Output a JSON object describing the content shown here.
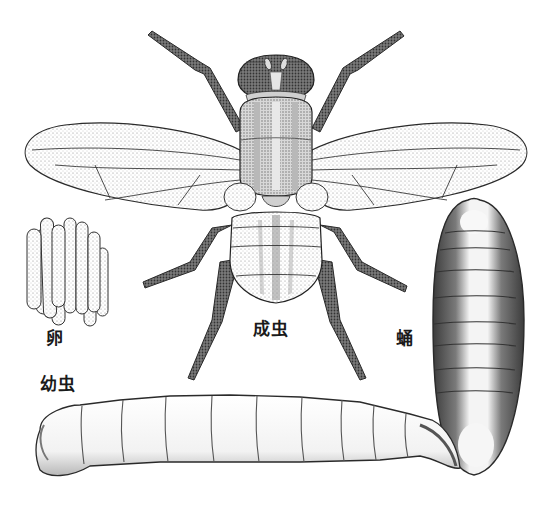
{
  "figure": {
    "labels": {
      "egg": "卵",
      "adult": "成虫",
      "pupa": "蛹",
      "larva": "幼虫"
    },
    "stages": [
      {
        "id": "egg",
        "label": "卵"
      },
      {
        "id": "larva",
        "label": "幼虫"
      },
      {
        "id": "pupa",
        "label": "蛹"
      },
      {
        "id": "adult",
        "label": "成虫"
      }
    ],
    "colors": {
      "background": "#ffffff",
      "ink": "#2a2a2a",
      "stipple": "#9a9a9a",
      "dark_body": "#4a4a4a"
    }
  }
}
